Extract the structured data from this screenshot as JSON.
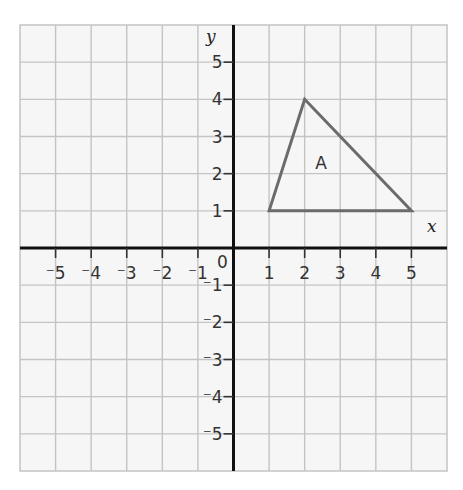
{
  "diagram": {
    "type": "coordinate-grid",
    "grid": {
      "x_range": [
        -6,
        6
      ],
      "y_range": [
        -6,
        6
      ],
      "cell_step": 1,
      "background": "#f6f6f6",
      "grid_line_color": "#c4c4c4",
      "axis_color": "#111111"
    },
    "axes": {
      "x_label": "x",
      "y_label": "y",
      "origin_label": "0",
      "x_ticks": [
        {
          "value": -5,
          "label": "⁻5"
        },
        {
          "value": -4,
          "label": "⁻4"
        },
        {
          "value": -3,
          "label": "⁻3"
        },
        {
          "value": -2,
          "label": "⁻2"
        },
        {
          "value": -1,
          "label": "⁻1"
        },
        {
          "value": 1,
          "label": "1"
        },
        {
          "value": 2,
          "label": "2"
        },
        {
          "value": 3,
          "label": "3"
        },
        {
          "value": 4,
          "label": "4"
        },
        {
          "value": 5,
          "label": "5"
        }
      ],
      "y_ticks": [
        {
          "value": 5,
          "label": "5"
        },
        {
          "value": 4,
          "label": "4"
        },
        {
          "value": 3,
          "label": "3"
        },
        {
          "value": 2,
          "label": "2"
        },
        {
          "value": 1,
          "label": "1"
        },
        {
          "value": -1,
          "label": "⁻1"
        },
        {
          "value": -2,
          "label": "⁻2"
        },
        {
          "value": -3,
          "label": "⁻3"
        },
        {
          "value": -4,
          "label": "⁻4"
        },
        {
          "value": -5,
          "label": "⁻5"
        }
      ]
    },
    "shapes": [
      {
        "name": "triangle-A",
        "label": "A",
        "label_position": [
          2.3,
          2.3
        ],
        "vertices": [
          [
            1,
            1
          ],
          [
            2,
            4
          ],
          [
            5,
            1
          ]
        ],
        "stroke": "#6b6b6b"
      }
    ]
  }
}
